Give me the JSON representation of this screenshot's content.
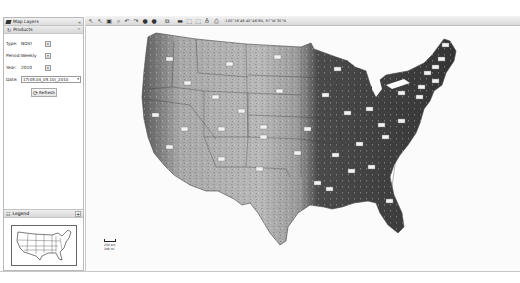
{
  "layers_panel": {
    "title": "Map Layers",
    "collapse_glyph": "«",
    "products_header": "Products",
    "fields": [
      {
        "label": "Type:",
        "value": "NDVI"
      },
      {
        "label": "Period:",
        "value": "Weekly"
      },
      {
        "label": "Year:",
        "value": "2010"
      }
    ],
    "date": {
      "label": "Date:",
      "value": "17(05.04_05.10)_2010"
    },
    "refresh_label": "Refresh"
  },
  "legend_panel": {
    "title": "Legend",
    "expand_glyph": "+"
  },
  "toolbar": {
    "icons": [
      "select-icon",
      "pan-select-icon",
      "zoom-extent-icon",
      "zoom-window-icon",
      "back-icon",
      "forward-icon",
      "zoom-in-icon",
      "zoom-out-icon",
      "layers-icon",
      "ruler-icon",
      "select-box-icon",
      "select-region-icon",
      "identify-icon",
      "export-icon"
    ],
    "coordinates": "-100°16'46 40°46'8N, 97°W 30°N"
  },
  "map": {
    "scale_top": "250 km",
    "scale_bottom": "200 mi",
    "colors": {
      "arid": "#bdbdbd",
      "mid": "#8a8a8a",
      "dense": "#3c3c3c",
      "water": "#fbfbfb"
    }
  }
}
